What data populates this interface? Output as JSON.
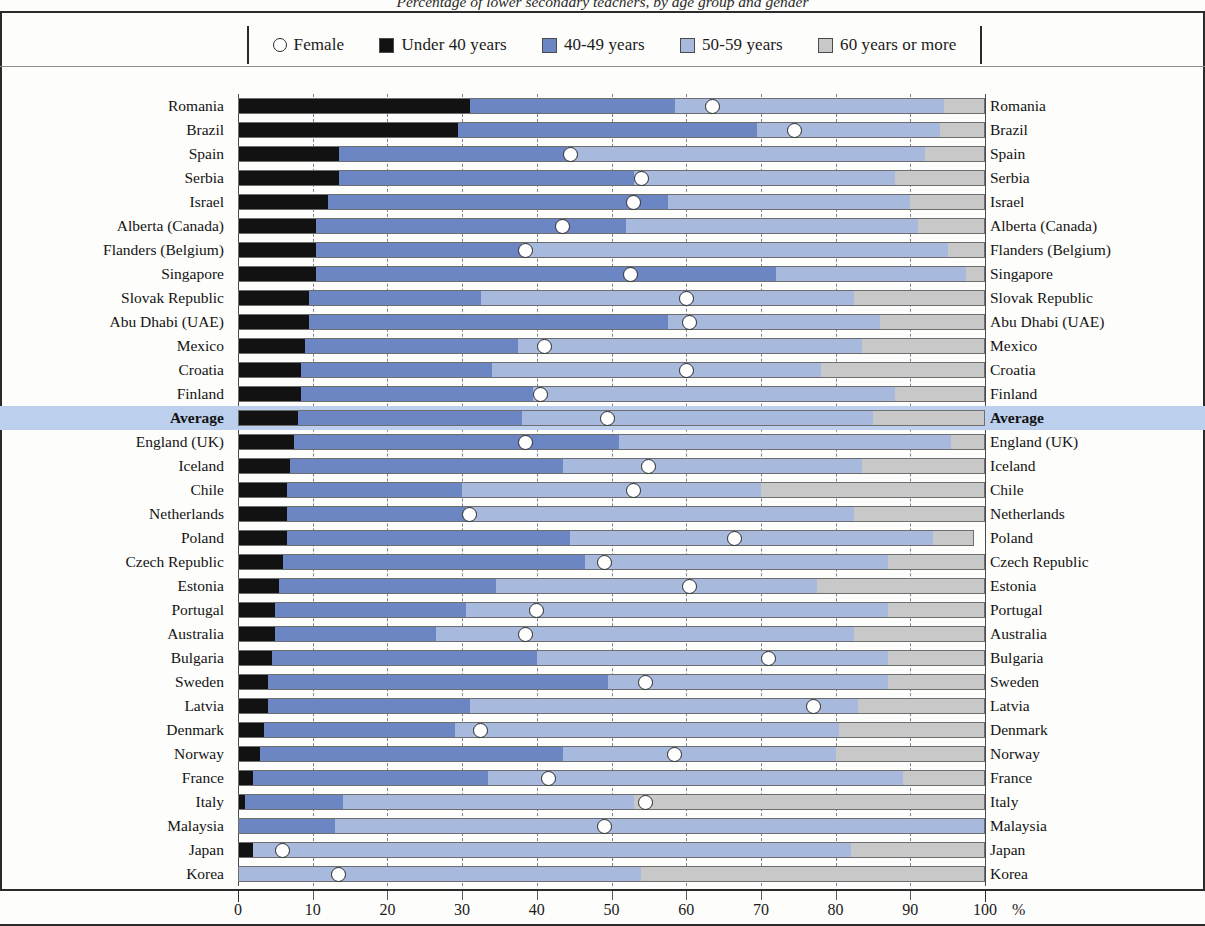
{
  "title": "Percentage of lower secondary teachers, by age group and gender",
  "axis": {
    "unit": "%",
    "ticks": [
      {
        "value": 0,
        "label": "0"
      },
      {
        "value": 10,
        "label": "10"
      },
      {
        "value": 20,
        "label": "20"
      },
      {
        "value": 30,
        "label": "30"
      },
      {
        "value": 40,
        "label": "40"
      },
      {
        "value": 50,
        "label": "50"
      },
      {
        "value": 60,
        "label": "60"
      },
      {
        "value": 70,
        "label": "70"
      },
      {
        "value": 80,
        "label": "80"
      },
      {
        "value": 90,
        "label": "90"
      },
      {
        "value": 100,
        "label": "100"
      }
    ]
  },
  "legend": [
    {
      "name": "female-marker",
      "label": "Female",
      "shape": "circle-outline",
      "color": "#ffffff"
    },
    {
      "name": "under-40-swatch",
      "label": "Under 40 years",
      "shape": "square",
      "color": "#121212"
    },
    {
      "name": "40-49-swatch",
      "label": "40-49 years",
      "shape": "square",
      "color": "#6b86c2"
    },
    {
      "name": "50-59-swatch",
      "label": "50-59 years",
      "shape": "square",
      "color": "#a7bade"
    },
    {
      "name": "60-or-more-swatch",
      "label": "60 years or more",
      "shape": "square",
      "color": "#c8c8c8"
    }
  ],
  "chart_data": {
    "type": "bar",
    "orientation": "horizontal",
    "stacked": true,
    "title": "Percentage of lower secondary teachers, by age group and gender",
    "xlabel": "%",
    "ylabel": "",
    "xlim": [
      0,
      100
    ],
    "grid": "vertical-dashed",
    "legend_position": "top",
    "series": [
      {
        "name": "Under 40 years",
        "color": "#121212"
      },
      {
        "name": "40-49 years",
        "color": "#6b86c2"
      },
      {
        "name": "50-59 years",
        "color": "#a7bade"
      },
      {
        "name": "60 years or more",
        "color": "#c8c8c8"
      }
    ],
    "marker_series": {
      "name": "Female",
      "color": "#ffffff",
      "edge": "#262626"
    },
    "categories": [
      "Romania",
      "Brazil",
      "Spain",
      "Serbia",
      "Israel",
      "Alberta (Canada)",
      "Flanders (Belgium)",
      "Singapore",
      "Slovak Republic",
      "Abu Dhabi (UAE)",
      "Mexico",
      "Croatia",
      "Finland",
      "Average",
      "England (UK)",
      "Iceland",
      "Chile",
      "Netherlands",
      "Poland",
      "Czech Republic",
      "Estonia",
      "Portugal",
      "Australia",
      "Bulgaria",
      "Sweden",
      "Latvia",
      "Denmark",
      "Norway",
      "France",
      "Italy",
      "Malaysia",
      "Japan",
      "Korea"
    ],
    "rows": [
      {
        "country": "Romania",
        "under40": 31.0,
        "a4049": 27.5,
        "a5059": 36.0,
        "a60plus": 5.5,
        "female": 63.5,
        "highlight": false
      },
      {
        "country": "Brazil",
        "under40": 29.5,
        "a4049": 40.0,
        "a5059": 24.5,
        "a60plus": 6.0,
        "female": 74.5,
        "highlight": false
      },
      {
        "country": "Spain",
        "under40": 13.5,
        "a4049": 30.5,
        "a5059": 48.0,
        "a60plus": 8.0,
        "female": 44.5,
        "highlight": false
      },
      {
        "country": "Serbia",
        "under40": 13.5,
        "a4049": 39.5,
        "a5059": 35.0,
        "a60plus": 12.0,
        "female": 54.0,
        "highlight": false
      },
      {
        "country": "Israel",
        "under40": 12.0,
        "a4049": 45.5,
        "a5059": 32.5,
        "a60plus": 10.0,
        "female": 53.0,
        "highlight": false
      },
      {
        "country": "Alberta (Canada)",
        "under40": 10.5,
        "a4049": 41.5,
        "a5059": 39.0,
        "a60plus": 9.0,
        "female": 43.5,
        "highlight": false
      },
      {
        "country": "Flanders (Belgium)",
        "under40": 10.5,
        "a4049": 27.5,
        "a5059": 57.0,
        "a60plus": 5.0,
        "female": 38.5,
        "highlight": false
      },
      {
        "country": "Singapore",
        "under40": 10.5,
        "a4049": 61.5,
        "a5059": 25.5,
        "a60plus": 2.5,
        "female": 52.5,
        "highlight": false
      },
      {
        "country": "Slovak Republic",
        "under40": 9.5,
        "a4049": 23.0,
        "a5059": 50.0,
        "a60plus": 17.5,
        "female": 60.0,
        "highlight": false
      },
      {
        "country": "Abu Dhabi (UAE)",
        "under40": 9.5,
        "a4049": 48.0,
        "a5059": 28.5,
        "a60plus": 14.0,
        "female": 60.5,
        "highlight": false
      },
      {
        "country": "Mexico",
        "under40": 9.0,
        "a4049": 28.5,
        "a5059": 46.0,
        "a60plus": 16.5,
        "female": 41.0,
        "highlight": false
      },
      {
        "country": "Croatia",
        "under40": 8.5,
        "a4049": 25.5,
        "a5059": 44.0,
        "a60plus": 22.0,
        "female": 60.0,
        "highlight": false
      },
      {
        "country": "Finland",
        "under40": 8.5,
        "a4049": 31.0,
        "a5059": 48.5,
        "a60plus": 12.0,
        "female": 40.5,
        "highlight": false
      },
      {
        "country": "Average",
        "under40": 8.0,
        "a4049": 30.0,
        "a5059": 47.0,
        "a60plus": 15.0,
        "female": 49.5,
        "highlight": true
      },
      {
        "country": "England (UK)",
        "under40": 7.5,
        "a4049": 43.5,
        "a5059": 44.5,
        "a60plus": 4.5,
        "female": 38.5,
        "highlight": false
      },
      {
        "country": "Iceland",
        "under40": 7.0,
        "a4049": 36.5,
        "a5059": 40.0,
        "a60plus": 16.5,
        "female": 55.0,
        "highlight": false
      },
      {
        "country": "Chile",
        "under40": 6.5,
        "a4049": 23.5,
        "a5059": 40.0,
        "a60plus": 30.0,
        "female": 53.0,
        "highlight": false
      },
      {
        "country": "Netherlands",
        "under40": 6.5,
        "a4049": 24.0,
        "a5059": 52.0,
        "a60plus": 17.5,
        "female": 31.0,
        "highlight": false
      },
      {
        "country": "Poland",
        "under40": 6.5,
        "a4049": 38.0,
        "a5059": 48.5,
        "a60plus": 5.5,
        "female": 66.5,
        "highlight": false
      },
      {
        "country": "Czech Republic",
        "under40": 6.0,
        "a4049": 40.5,
        "a5059": 40.5,
        "a60plus": 13.0,
        "female": 49.0,
        "highlight": false
      },
      {
        "country": "Estonia",
        "under40": 5.5,
        "a4049": 29.0,
        "a5059": 43.0,
        "a60plus": 22.5,
        "female": 60.5,
        "highlight": false
      },
      {
        "country": "Portugal",
        "under40": 5.0,
        "a4049": 25.5,
        "a5059": 56.5,
        "a60plus": 13.0,
        "female": 40.0,
        "highlight": false
      },
      {
        "country": "Australia",
        "under40": 5.0,
        "a4049": 21.5,
        "a5059": 56.0,
        "a60plus": 17.5,
        "female": 38.5,
        "highlight": false
      },
      {
        "country": "Bulgaria",
        "under40": 4.5,
        "a4049": 35.5,
        "a5059": 47.0,
        "a60plus": 13.0,
        "female": 71.0,
        "highlight": false
      },
      {
        "country": "Sweden",
        "under40": 4.0,
        "a4049": 45.5,
        "a5059": 37.5,
        "a60plus": 13.0,
        "female": 54.5,
        "highlight": false
      },
      {
        "country": "Latvia",
        "under40": 4.0,
        "a4049": 27.0,
        "a5059": 52.0,
        "a60plus": 17.0,
        "female": 77.0,
        "highlight": false
      },
      {
        "country": "Denmark",
        "under40": 3.5,
        "a4049": 25.5,
        "a5059": 51.5,
        "a60plus": 19.5,
        "female": 32.5,
        "highlight": false
      },
      {
        "country": "Norway",
        "under40": 3.0,
        "a4049": 40.5,
        "a5059": 36.5,
        "a60plus": 20.0,
        "female": 58.5,
        "highlight": false
      },
      {
        "country": "France",
        "under40": 2.0,
        "a4049": 31.5,
        "a5059": 55.5,
        "a60plus": 11.0,
        "female": 41.5,
        "highlight": false
      },
      {
        "country": "Italy",
        "under40": 1.0,
        "a4049": 13.0,
        "a5059": 39.0,
        "a60plus": 47.0,
        "female": 54.5,
        "highlight": false
      },
      {
        "country": "Malaysia",
        "under40": 0.0,
        "a4049": 13.0,
        "a5059": 87.0,
        "a60plus": 0.0,
        "female": 49.0,
        "highlight": false
      },
      {
        "country": "Japan",
        "under40": 2.0,
        "a4049": 0.0,
        "a5059": 80.0,
        "a60plus": 18.0,
        "female": 6.0,
        "highlight": false
      },
      {
        "country": "Korea",
        "under40": 0.0,
        "a4049": 0.0,
        "a5059": 54.0,
        "a60plus": 46.0,
        "female": 13.5,
        "highlight": false
      }
    ]
  }
}
